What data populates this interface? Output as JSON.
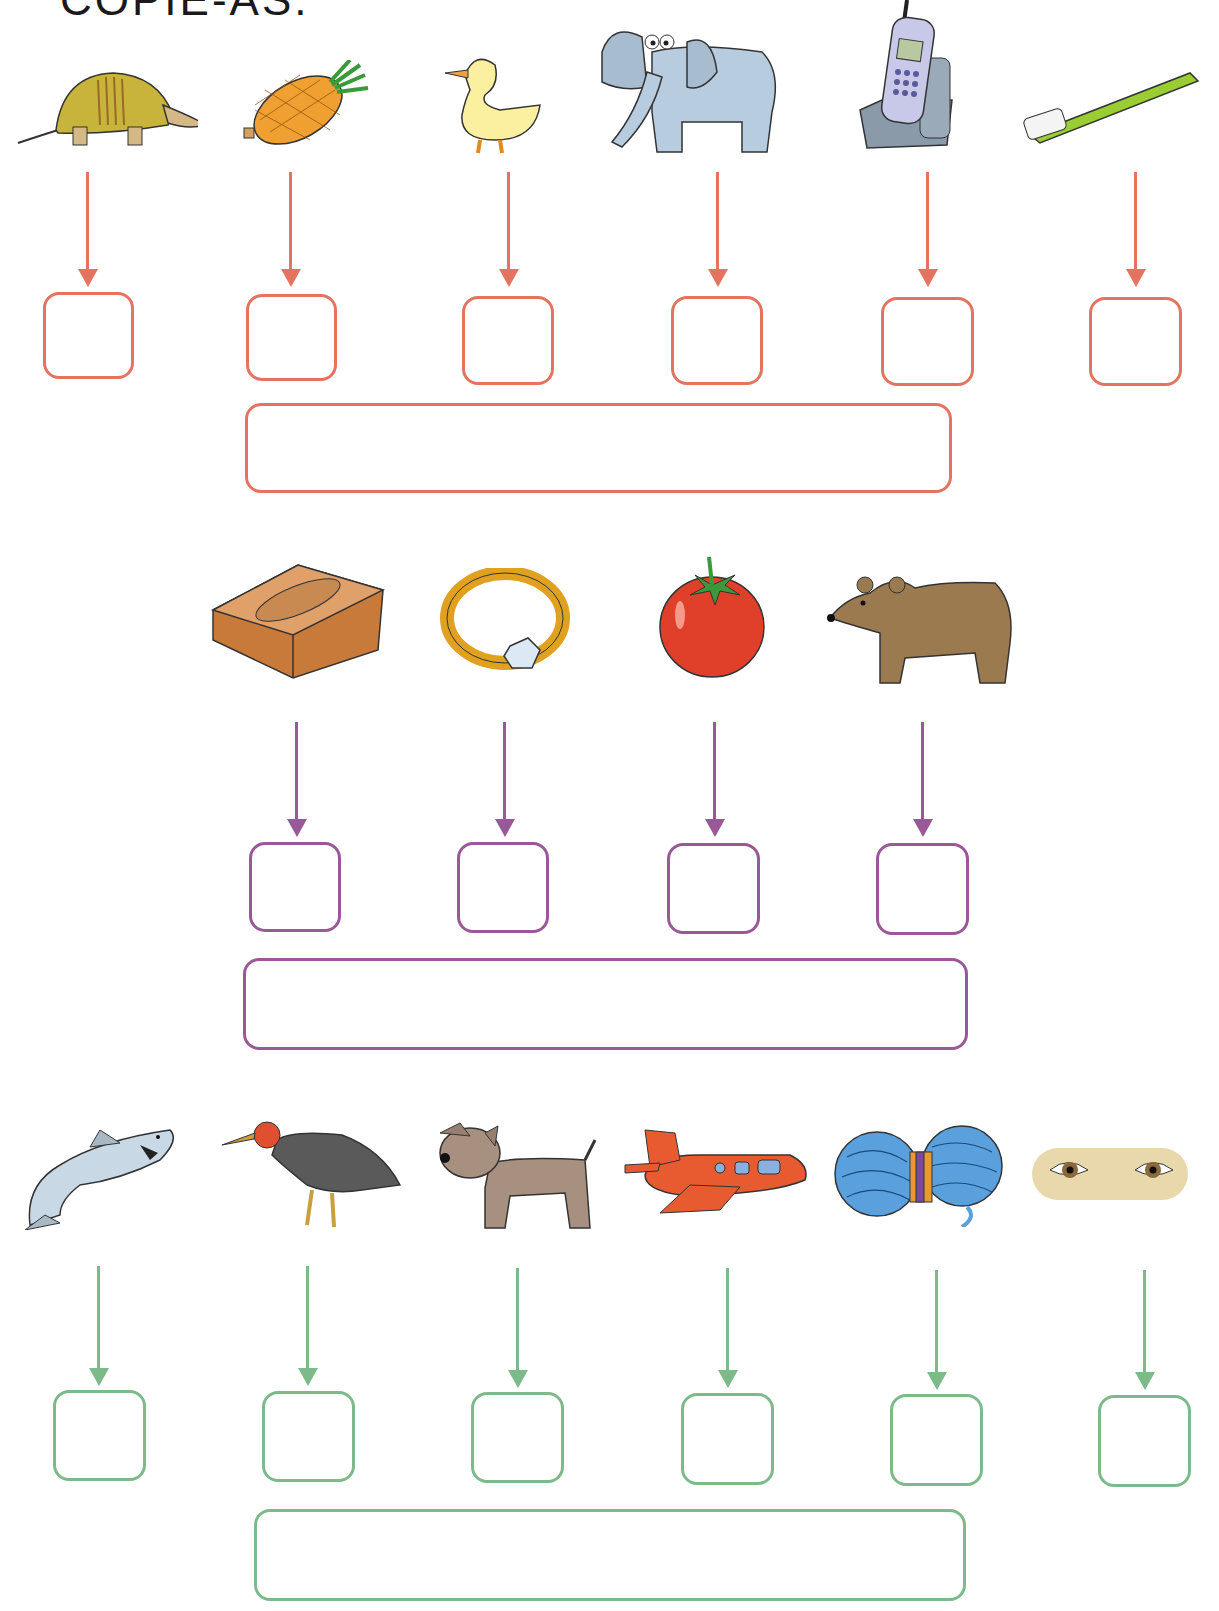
{
  "instruction": "COPIE-AS.",
  "colors": {
    "row1": "#e4735f",
    "row2": "#9a5898",
    "row3": "#7dba8a"
  },
  "rows": [
    {
      "items": [
        {
          "name": "armadillo",
          "box_value": ""
        },
        {
          "name": "pineapple",
          "box_value": ""
        },
        {
          "name": "duck",
          "box_value": ""
        },
        {
          "name": "elephant",
          "box_value": ""
        },
        {
          "name": "cordless-phone",
          "box_value": ""
        },
        {
          "name": "toothbrush",
          "box_value": ""
        }
      ],
      "word_box_value": ""
    },
    {
      "items": [
        {
          "name": "brick",
          "box_value": ""
        },
        {
          "name": "ring",
          "box_value": ""
        },
        {
          "name": "tomato",
          "box_value": ""
        },
        {
          "name": "bear",
          "box_value": ""
        }
      ],
      "word_box_value": ""
    },
    {
      "items": [
        {
          "name": "shark",
          "box_value": ""
        },
        {
          "name": "turkey-bird",
          "box_value": ""
        },
        {
          "name": "dog",
          "box_value": ""
        },
        {
          "name": "airplane",
          "box_value": ""
        },
        {
          "name": "yarn-ball",
          "box_value": ""
        },
        {
          "name": "eyes",
          "box_value": ""
        }
      ],
      "word_box_value": ""
    }
  ]
}
